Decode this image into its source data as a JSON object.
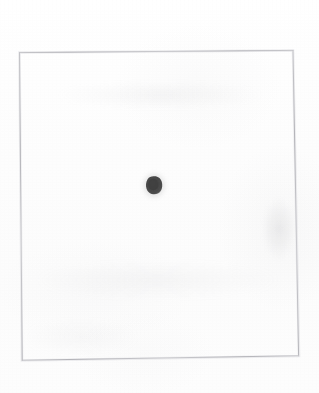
{
  "image": {
    "title": "Scanned card with single dot",
    "width": 319,
    "height": 393,
    "background_color": "#fdfdfd",
    "caption": ""
  },
  "frame": {
    "name": "card-border",
    "description": "thin faint rectangular outline of a scanned card",
    "stroke_color": "#b9b9bc",
    "stroke_width": 1,
    "rotation_degrees": 0.6,
    "corners": {
      "top_left": [
        19,
        52
      ],
      "top_right": [
        293,
        50
      ],
      "bottom_right": [
        299,
        356
      ],
      "bottom_left": [
        22,
        360
      ]
    }
  },
  "marks": [
    {
      "name": "center-dot",
      "shape": "irregular-blob",
      "center": [
        154,
        185
      ],
      "width": 16,
      "height": 18,
      "fill_color": "#474747",
      "edge_color": "#6e6e6e",
      "count_label": "1"
    }
  ],
  "smudges": [
    {
      "name": "smudge-right",
      "center": [
        279,
        229
      ],
      "color": "#b0b0b4"
    },
    {
      "name": "smudge-top-band",
      "center": [
        160,
        95
      ],
      "color": "#babac0"
    },
    {
      "name": "smudge-lower-band",
      "center": [
        158,
        280
      ],
      "color": "#bcbcc0"
    },
    {
      "name": "smudge-bottom-left",
      "center": [
        81,
        337
      ],
      "color": "#bebec2"
    }
  ]
}
